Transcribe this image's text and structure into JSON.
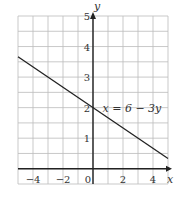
{
  "chart_data": {
    "type": "line",
    "title": "",
    "xlabel": "x",
    "ylabel": "y",
    "xlim": [
      -5,
      5
    ],
    "ylim": [
      -0.5,
      5
    ],
    "grid": true,
    "grid_step_x": 1,
    "grid_step_y": 0.5,
    "x_ticks": [
      -4,
      -2,
      0,
      2,
      4
    ],
    "x_tick_labels": [
      "−4",
      "−2",
      "0",
      "2",
      "4"
    ],
    "y_ticks": [
      1,
      2,
      3,
      4,
      5
    ],
    "y_tick_labels": [
      "1",
      "2",
      "3",
      "4",
      "5"
    ],
    "series": [
      {
        "name": "x = 6 − 3y",
        "equation": "x = 6 - 3y",
        "x": [
          -5,
          5
        ],
        "y": [
          3.667,
          0.333
        ]
      }
    ],
    "annotations": [
      {
        "text": "x = 6 − 3y",
        "x": 0.5,
        "y": 2
      }
    ]
  }
}
